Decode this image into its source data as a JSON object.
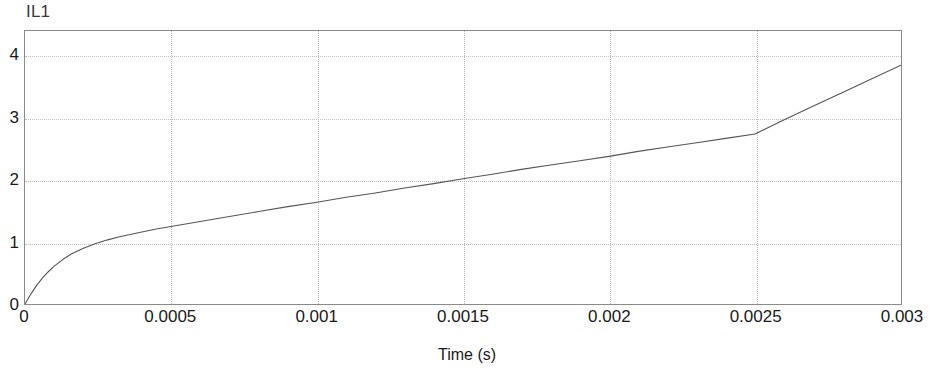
{
  "chart_data": {
    "type": "line",
    "title": "IL1",
    "xlabel": "Time (s)",
    "ylabel": "",
    "xlim": [
      0,
      0.003
    ],
    "ylim": [
      0,
      4.4
    ],
    "grid": true,
    "legend": null,
    "xticks": [
      0,
      0.0005,
      0.001,
      0.0015,
      0.002,
      0.0025,
      0.003
    ],
    "xtick_labels": [
      "0",
      "0.0005",
      "0.001",
      "0.0015",
      "0.002",
      "0.0025",
      "0.003"
    ],
    "yticks": [
      0,
      1,
      2,
      3,
      4
    ],
    "ytick_labels": [
      "0",
      "1",
      "2",
      "3",
      "4"
    ],
    "series": [
      {
        "name": "IL1",
        "color": "#555555",
        "x": [
          0,
          2e-05,
          4e-05,
          6e-05,
          8e-05,
          0.0001,
          0.00013,
          0.00016,
          0.0002,
          0.00024,
          0.00028,
          0.00032,
          0.00036,
          0.0004,
          0.00045,
          0.0005,
          0.0006,
          0.0007,
          0.0008,
          0.0009,
          0.001,
          0.0011,
          0.0012,
          0.0013,
          0.0014,
          0.0015,
          0.0016,
          0.0017,
          0.0018,
          0.0019,
          0.002,
          0.0021,
          0.0022,
          0.0023,
          0.0024,
          0.0025,
          0.0026,
          0.0027,
          0.0028,
          0.0029,
          0.003
        ],
        "y": [
          0.0,
          0.16,
          0.3,
          0.42,
          0.52,
          0.61,
          0.72,
          0.81,
          0.9,
          0.97,
          1.03,
          1.08,
          1.12,
          1.16,
          1.21,
          1.25,
          1.33,
          1.41,
          1.49,
          1.57,
          1.64,
          1.72,
          1.79,
          1.87,
          1.94,
          2.02,
          2.09,
          2.17,
          2.24,
          2.31,
          2.38,
          2.46,
          2.53,
          2.6,
          2.67,
          2.74,
          2.97,
          3.19,
          3.41,
          3.63,
          3.85
        ]
      }
    ],
    "annotations": []
  },
  "plot": {
    "title": "IL1",
    "xaxis_label": "Time (s)"
  }
}
